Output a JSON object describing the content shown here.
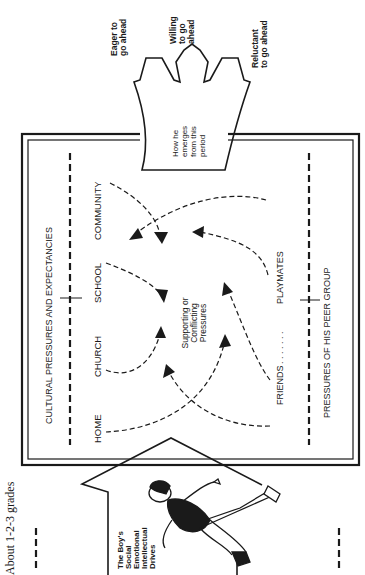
{
  "caption": "About 1-2-3 grades",
  "outcome_arrow": {
    "body_label": [
      "How he",
      "emerges",
      "from this",
      "period"
    ],
    "branches": [
      {
        "id": "eager",
        "lines": [
          "Eager to",
          "go ahead"
        ]
      },
      {
        "id": "willing",
        "lines": [
          "Willing",
          "to go",
          "ahead"
        ]
      },
      {
        "id": "reluctant",
        "lines": [
          "Reluctant",
          "to go ahead"
        ]
      }
    ]
  },
  "frame": {
    "top_heading": "CULTURAL PRESSURES AND EXPECTANCIES",
    "bottom_heading": "PRESSURES OF HIS PEER GROUP",
    "cultural_sources": [
      "HOME",
      "CHURCH",
      "SCHOOL",
      "COMMUNITY"
    ],
    "peer_sources": {
      "left": "FRIENDS",
      "leader": ". . . . . . .",
      "right": "PLAYMATES"
    },
    "center_label": [
      "Supporting or",
      "Conflicting",
      "Pressures"
    ]
  },
  "input_arrow": {
    "label": [
      "The Boy's",
      "Social",
      "Emotional",
      "Intellectual",
      "Drives"
    ]
  },
  "colors": {
    "ink": "#1a1a1a",
    "paper": "#ffffff"
  }
}
